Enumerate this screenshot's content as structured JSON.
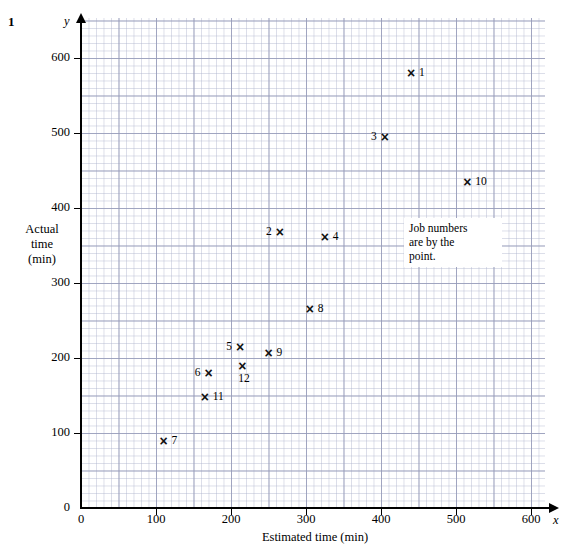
{
  "question_number": "1",
  "annotation": {
    "text": "Job numbers are by the point.",
    "line1": "Job numbers",
    "line2": "are by the",
    "line3": "point."
  },
  "axes": {
    "x_letter": "x",
    "y_letter": "y",
    "x_title": "Estimated time (min)",
    "y_title_line1": "Actual",
    "y_title_line2": "time",
    "y_title_line3": "(min)",
    "x_ticks": [
      "0",
      "100",
      "200",
      "300",
      "400",
      "500",
      "600"
    ],
    "y_ticks": [
      "0",
      "100",
      "200",
      "300",
      "400",
      "500",
      "600"
    ],
    "origin_label": "0"
  },
  "chart_data": {
    "type": "scatter",
    "title": "",
    "xlabel": "Estimated time (min)",
    "ylabel": "Actual time (min)",
    "xlim": [
      0,
      620
    ],
    "ylim": [
      0,
      650
    ],
    "xticks": [
      0,
      100,
      200,
      300,
      400,
      500,
      600
    ],
    "yticks": [
      0,
      100,
      200,
      300,
      400,
      500,
      600
    ],
    "grid": true,
    "grid_minor_step": 10,
    "grid_major_step": 50,
    "legend": "none",
    "annotations": [
      "Job numbers are by the point."
    ],
    "point_label_key": "Job number",
    "points": [
      {
        "label": "1",
        "x": 440,
        "y": 580,
        "label_pos": "right"
      },
      {
        "label": "2",
        "x": 265,
        "y": 368,
        "label_pos": "left"
      },
      {
        "label": "3",
        "x": 405,
        "y": 495,
        "label_pos": "left"
      },
      {
        "label": "4",
        "x": 325,
        "y": 362,
        "label_pos": "right"
      },
      {
        "label": "5",
        "x": 212,
        "y": 215,
        "label_pos": "left"
      },
      {
        "label": "6",
        "x": 170,
        "y": 180,
        "label_pos": "left"
      },
      {
        "label": "7",
        "x": 110,
        "y": 90,
        "label_pos": "right"
      },
      {
        "label": "8",
        "x": 305,
        "y": 265,
        "label_pos": "right"
      },
      {
        "label": "9",
        "x": 250,
        "y": 207,
        "label_pos": "right"
      },
      {
        "label": "10",
        "x": 515,
        "y": 435,
        "label_pos": "right"
      },
      {
        "label": "11",
        "x": 165,
        "y": 148,
        "label_pos": "right"
      },
      {
        "label": "12",
        "x": 215,
        "y": 190,
        "label_pos": "below"
      }
    ],
    "marker": "×"
  }
}
